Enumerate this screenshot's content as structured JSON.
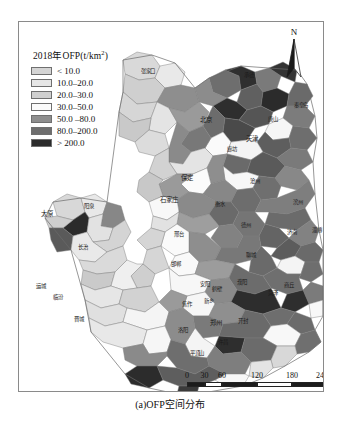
{
  "figure": {
    "caption": "(a)OFP空间分布"
  },
  "legend": {
    "title_main": "2018年OFP(t/km",
    "title_sup": "2",
    "title_tail": ")",
    "title_full": "2018年OFP(t/km2)",
    "items": [
      {
        "label": "< 10.0",
        "color": "#d4d4d4"
      },
      {
        "label": "10.0–20.0",
        "color": "#e6e6e6"
      },
      {
        "label": "20.0–30.0",
        "color": "#cfcfcf"
      },
      {
        "label": "30.0–50.0",
        "color": "#fbfbfb"
      },
      {
        "label": "50.0 –80.0",
        "color": "#8e8e8e"
      },
      {
        "label": "80.0–200.0",
        "color": "#6e6e6e"
      },
      {
        "label": "> 200.0",
        "color": "#2b2b2b"
      }
    ]
  },
  "north_arrow": {
    "letter": "N",
    "icon": "north-arrow-icon"
  },
  "scalebar": {
    "unit_suffix": "km",
    "ticks": [
      "0",
      "30",
      "60",
      "120",
      "180",
      "240km"
    ],
    "tick_positions_px": [
      0,
      17.5,
      35,
      70,
      105,
      140
    ],
    "segments": [
      {
        "fill": "dark",
        "width_px": 17.5
      },
      {
        "fill": "light",
        "width_px": 17.5
      },
      {
        "fill": "dark",
        "width_px": 35
      },
      {
        "fill": "light",
        "width_px": 35
      },
      {
        "fill": "dark",
        "width_px": 35
      }
    ]
  },
  "map": {
    "frame": {
      "x": 18,
      "y": 21,
      "w": 304,
      "h": 369
    },
    "places": [
      {
        "name": "太原",
        "x": 46,
        "y": 212,
        "size": "big"
      },
      {
        "name": "阳泉",
        "x": 88,
        "y": 205,
        "size": ""
      },
      {
        "name": "长治",
        "x": 82,
        "y": 246,
        "size": ""
      },
      {
        "name": "晋城",
        "x": 78,
        "y": 318,
        "size": ""
      },
      {
        "name": "运城",
        "x": 40,
        "y": 285,
        "size": ""
      },
      {
        "name": "临汾",
        "x": 57,
        "y": 296,
        "size": ""
      },
      {
        "name": "张家口",
        "x": 147,
        "y": 70,
        "size": ""
      },
      {
        "name": "北京",
        "x": 205,
        "y": 118,
        "size": "big"
      },
      {
        "name": "天津",
        "x": 251,
        "y": 137,
        "size": "big"
      },
      {
        "name": "承德",
        "x": 248,
        "y": 74,
        "size": ""
      },
      {
        "name": "唐山",
        "x": 272,
        "y": 118,
        "size": ""
      },
      {
        "name": "秦皇岛",
        "x": 300,
        "y": 104,
        "size": ""
      },
      {
        "name": "保定",
        "x": 186,
        "y": 176,
        "size": "big"
      },
      {
        "name": "廊坊",
        "x": 231,
        "y": 148,
        "size": ""
      },
      {
        "name": "沧州",
        "x": 254,
        "y": 180,
        "size": ""
      },
      {
        "name": "石家庄",
        "x": 168,
        "y": 198,
        "size": "big"
      },
      {
        "name": "衡水",
        "x": 219,
        "y": 203,
        "size": ""
      },
      {
        "name": "邢台",
        "x": 178,
        "y": 233,
        "size": ""
      },
      {
        "name": "邯郸",
        "x": 175,
        "y": 263,
        "size": ""
      },
      {
        "name": "德州",
        "x": 245,
        "y": 224,
        "size": ""
      },
      {
        "name": "滨州",
        "x": 297,
        "y": 201,
        "size": ""
      },
      {
        "name": "聊城",
        "x": 250,
        "y": 254,
        "size": ""
      },
      {
        "name": "济南",
        "x": 291,
        "y": 231,
        "size": ""
      },
      {
        "name": "淄博",
        "x": 316,
        "y": 229,
        "size": ""
      },
      {
        "name": "安阳",
        "x": 204,
        "y": 283,
        "size": ""
      },
      {
        "name": "濮阳",
        "x": 241,
        "y": 281,
        "size": ""
      },
      {
        "name": "菏泽",
        "x": 272,
        "y": 292,
        "size": ""
      },
      {
        "name": "新乡",
        "x": 208,
        "y": 300,
        "size": ""
      },
      {
        "name": "焦作",
        "x": 186,
        "y": 303,
        "size": ""
      },
      {
        "name": "鹤壁",
        "x": 216,
        "y": 288,
        "size": ""
      },
      {
        "name": "开封",
        "x": 242,
        "y": 320,
        "size": ""
      },
      {
        "name": "郑州",
        "x": 215,
        "y": 321,
        "size": "big"
      },
      {
        "name": "商丘",
        "x": 288,
        "y": 284,
        "size": ""
      },
      {
        "name": "洛阳",
        "x": 182,
        "y": 329,
        "size": ""
      },
      {
        "name": "许昌",
        "x": 222,
        "y": 341,
        "size": ""
      },
      {
        "name": "平顶山",
        "x": 196,
        "y": 352,
        "size": ""
      }
    ]
  },
  "chart_data": {
    "type": "map",
    "title": "(a)OFP空间分布",
    "legend_title": "2018年OFP(t/km2)",
    "variable": "OFP",
    "unit": "t/km2",
    "year": 2018,
    "classes": [
      {
        "label": "< 10.0",
        "min": null,
        "max": 10.0,
        "color": "#d4d4d4"
      },
      {
        "label": "10.0–20.0",
        "min": 10.0,
        "max": 20.0,
        "color": "#e6e6e6"
      },
      {
        "label": "20.0–30.0",
        "min": 20.0,
        "max": 30.0,
        "color": "#cfcfcf"
      },
      {
        "label": "30.0–50.0",
        "min": 30.0,
        "max": 50.0,
        "color": "#fbfbfb"
      },
      {
        "label": "50.0 –80.0",
        "min": 50.0,
        "max": 80.0,
        "color": "#8e8e8e"
      },
      {
        "label": "80.0–200.0",
        "min": 80.0,
        "max": 200.0,
        "color": "#6e6e6e"
      },
      {
        "label": "> 200.0",
        "min": 200.0,
        "max": null,
        "color": "#2b2b2b"
      }
    ],
    "scale_ticks_km": [
      0,
      30,
      60,
      120,
      180,
      240
    ],
    "grid": false,
    "legend_position": "top-left"
  }
}
